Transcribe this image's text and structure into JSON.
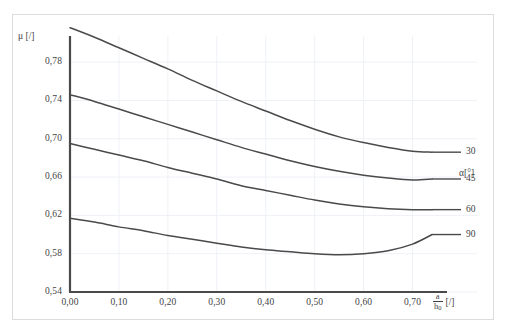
{
  "chart_data": {
    "type": "line",
    "title": "",
    "subtitle": "",
    "xlabel": "a/h0 [/]",
    "ylabel": "μ [/]",
    "xlabel_parts": {
      "numerator": "a",
      "denominator": "h",
      "denominator_sub": "0",
      "unit": "[/]"
    },
    "xlim": [
      0.0,
      0.75
    ],
    "ylim": [
      0.54,
      0.8
    ],
    "xticks": [
      0.0,
      0.1,
      0.2,
      0.3,
      0.4,
      0.5,
      0.6,
      0.7
    ],
    "xticklabels": [
      "0,00",
      "0,10",
      "0,20",
      "0,30",
      "0,40",
      "0,50",
      "0,60",
      "0,70"
    ],
    "yticks": [
      0.54,
      0.58,
      0.62,
      0.66,
      0.7,
      0.74,
      0.78
    ],
    "yticklabels": [
      "0,54",
      "0,58",
      "0,62",
      "0,66",
      "0,70",
      "0,74",
      "0,78"
    ],
    "grid": true,
    "grid_color": "#eef1f6",
    "line_color": "#4a4a4a",
    "axis_color": "#4a4a4a",
    "frame_color": "#dcdcdc",
    "legend_position": "right-outside",
    "legend_title": "α[°]",
    "legend_entries": [
      "30",
      "45",
      "60",
      "90"
    ],
    "x": [
      0.0,
      0.05,
      0.1,
      0.15,
      0.2,
      0.25,
      0.3,
      0.35,
      0.4,
      0.45,
      0.5,
      0.55,
      0.6,
      0.65,
      0.7,
      0.74
    ],
    "series": [
      {
        "name": "30",
        "values": [
          0.816,
          0.806,
          0.795,
          0.784,
          0.773,
          0.761,
          0.75,
          0.739,
          0.729,
          0.719,
          0.71,
          0.702,
          0.696,
          0.691,
          0.687,
          0.686
        ]
      },
      {
        "name": "45",
        "values": [
          0.746,
          0.739,
          0.731,
          0.723,
          0.715,
          0.707,
          0.699,
          0.691,
          0.684,
          0.677,
          0.671,
          0.666,
          0.662,
          0.659,
          0.657,
          0.658
        ]
      },
      {
        "name": "60",
        "values": [
          0.695,
          0.689,
          0.683,
          0.677,
          0.67,
          0.664,
          0.658,
          0.651,
          0.646,
          0.641,
          0.636,
          0.632,
          0.629,
          0.627,
          0.626,
          0.626
        ]
      },
      {
        "name": "90",
        "values": [
          0.617,
          0.613,
          0.608,
          0.604,
          0.599,
          0.595,
          0.591,
          0.587,
          0.584,
          0.582,
          0.58,
          0.579,
          0.58,
          0.583,
          0.59,
          0.6
        ]
      }
    ]
  }
}
